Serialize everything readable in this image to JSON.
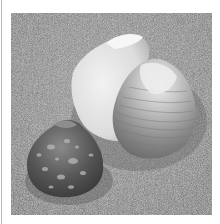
{
  "image": {
    "description": "Grayscale photograph of two seashells resting on sand",
    "subjects": [
      {
        "name": "large-open-clam-shell",
        "position": "upper-right"
      },
      {
        "name": "small-speckled-shell",
        "position": "lower-left"
      }
    ],
    "background": "sand",
    "colors": {
      "border": "#ffffff",
      "sand": "#8a8a8a",
      "shell_light": "#e6e6e6",
      "shell_mid": "#9a9a9a",
      "shell_dark": "#4a4a4a"
    }
  }
}
